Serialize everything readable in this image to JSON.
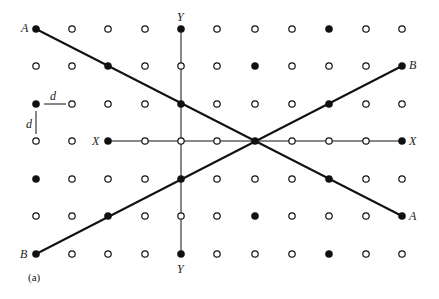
{
  "figure": {
    "caption": "(a)",
    "grid": {
      "columns_x": [
        36,
        72,
        108,
        145,
        181,
        217,
        255,
        292,
        329,
        366,
        402
      ],
      "rows_y": [
        29,
        66,
        104,
        141,
        179,
        216,
        254
      ],
      "filled": [
        [
          0,
          0
        ],
        [
          0,
          4
        ],
        [
          0,
          8
        ],
        [
          1,
          2
        ],
        [
          1,
          6
        ],
        [
          1,
          10
        ],
        [
          2,
          0
        ],
        [
          2,
          4
        ],
        [
          2,
          8
        ],
        [
          3,
          2
        ],
        [
          3,
          6
        ],
        [
          3,
          10
        ],
        [
          4,
          0
        ],
        [
          4,
          4
        ],
        [
          4,
          8
        ],
        [
          5,
          2
        ],
        [
          5,
          6
        ],
        [
          5,
          10
        ],
        [
          6,
          0
        ],
        [
          6,
          4
        ],
        [
          6,
          8
        ]
      ]
    },
    "lines": [
      {
        "name": "A-A",
        "from": [
          0,
          0
        ],
        "to": [
          5,
          10
        ],
        "weight": "thick"
      },
      {
        "name": "B-B",
        "from": [
          6,
          0
        ],
        "to": [
          1,
          10
        ],
        "weight": "thick"
      },
      {
        "name": "X-X",
        "from": [
          3,
          2
        ],
        "to": [
          3,
          10
        ],
        "weight": "thin"
      },
      {
        "name": "Y-Y",
        "from": [
          0,
          4
        ],
        "to": [
          6,
          4
        ],
        "weight": "thin"
      }
    ],
    "labels": {
      "a_left": "A",
      "a_right": "A",
      "b_left": "B",
      "b_right": "B",
      "x_left": "X",
      "x_right": "X",
      "y_top": "Y",
      "y_bottom": "Y",
      "d_horizontal": "d",
      "d_vertical": "d"
    },
    "colors": {
      "ink": "#111111",
      "background": "#ffffff"
    }
  }
}
